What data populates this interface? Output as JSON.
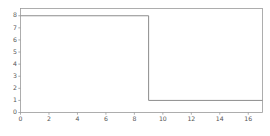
{
  "chart_data": {
    "type": "line",
    "title": "",
    "subtitle": "",
    "xlabel": "",
    "ylabel": "",
    "xlim": [
      0,
      17
    ],
    "ylim": [
      0,
      8.6
    ],
    "grid": false,
    "legend": null,
    "legend_position": "none",
    "annotations": [],
    "xticks": [
      0,
      2,
      4,
      6,
      8,
      10,
      12,
      14,
      16
    ],
    "xtick_labels": [
      "0",
      "2",
      "4",
      "6",
      "8",
      "10",
      "12",
      "14",
      "16"
    ],
    "yticks": [
      0,
      1,
      2,
      3,
      4,
      5,
      6,
      7,
      8
    ],
    "ytick_labels": [
      "0",
      "1",
      "2",
      "3",
      "4",
      "5",
      "6",
      "7",
      "8"
    ],
    "series": [
      {
        "name": "step",
        "drawstyle": "steps-post",
        "color": "#8c8c8c",
        "x": [
          0,
          9,
          9,
          17
        ],
        "y": [
          8,
          8,
          1,
          1
        ]
      }
    ],
    "step_description": {
      "high_value": 8,
      "low_value": 1,
      "step_x": 9,
      "x_start": 0,
      "x_end": 17
    }
  },
  "style": {
    "background": "#ffffff",
    "axis_color": "#9a9a9a",
    "tick_label_color": "#555555",
    "line_color": "#8c8c8c"
  }
}
